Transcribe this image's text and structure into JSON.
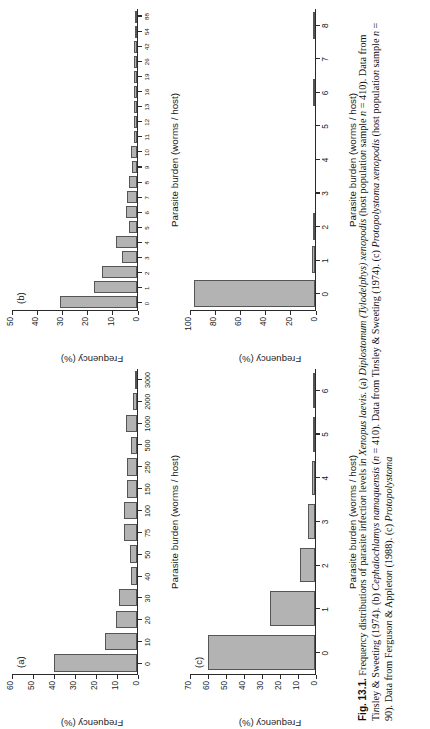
{
  "figure": {
    "label": "Fig. 13.1.",
    "caption_text": "Frequency distributions of parasite infection levels in Xenopus laevis. (a) Diplostomum (Tylodelphys) xenopodis (host population sample n = 410). Data from Tinsley & Sweeting (1974). (b) Cephalochlamys namaquensis (n = 410). Data from Tinsley & Sweeting (1974). (c) Protopolystoma xenopodis (host population sample n = 90). Data from Ferguson & Appleton (1988). (c) Protopolystoma",
    "caption_full": "Fig. 13.1. Frequency distributions of parasite infection levels in Xenopus laevis. (a) Diplostomum (Tylodelphys) xenopodis (host population sample n = 410). Data from Tinsley & Sweeting (1974). (b) Cephalochlamys namaquensis (n = 410). Data from Ferguson & Appleton (1988). (c) Protopolystoma"
  },
  "axis_titles": {
    "x": "Parasite burden (worms / host)",
    "y": "Frequency (%)"
  },
  "chart_data": [
    {
      "id": "a",
      "panel_letter": "(a)",
      "type": "bar",
      "title": "",
      "xlabel": "Parasite burden (worms / host)",
      "ylabel": "Frequency (%)",
      "ylim": [
        0,
        60
      ],
      "yticks": [
        0,
        10,
        20,
        30,
        40,
        50,
        60
      ],
      "grid": false,
      "categories": [
        "0",
        "10",
        "20",
        "30",
        "40",
        "50",
        "75",
        "100",
        "150",
        "250",
        "500",
        "1000",
        "2000",
        "3000"
      ],
      "values": [
        40.0,
        15.3,
        10.0,
        8.6,
        3.0,
        3.4,
        6.2,
        6.4,
        4.6,
        5.0,
        3.0,
        5.4,
        2.0,
        0.6
      ]
    },
    {
      "id": "b",
      "panel_letter": "(b)",
      "type": "bar",
      "title": "",
      "xlabel": "Parasite burden (worms / host)",
      "ylabel": "Frequency (%)",
      "ylim": [
        0,
        50
      ],
      "yticks": [
        0,
        10,
        20,
        30,
        40,
        50
      ],
      "grid": false,
      "categories": [
        "0",
        "1",
        "2",
        "3",
        "4",
        "5",
        "6",
        "7",
        "8",
        "9",
        "10",
        "11",
        "12",
        "13",
        "16",
        "19",
        "26",
        "42",
        "54",
        "88"
      ],
      "values": [
        31.0,
        17.4,
        14.2,
        6.0,
        8.6,
        3.2,
        4.6,
        4.0,
        3.2,
        2.0,
        2.6,
        1.3,
        1.1,
        1.2,
        1.2,
        1.1,
        1.1,
        1.1,
        1.0,
        1.0
      ]
    },
    {
      "id": "c",
      "panel_letter": "(c)",
      "type": "bar",
      "title": "",
      "xlabel": "Parasite burden (worms / host)",
      "ylabel": "Frequency (%)",
      "ylim": [
        0,
        70
      ],
      "yticks": [
        0,
        10,
        20,
        30,
        40,
        50,
        60,
        70
      ],
      "grid": false,
      "categories": [
        "0",
        "1",
        "2",
        "3",
        "4",
        "5",
        "6"
      ],
      "values": [
        60.0,
        25.0,
        8.6,
        4.0,
        1.6,
        1.4,
        1.0
      ]
    },
    {
      "id": "d",
      "panel_letter": "(d)",
      "type": "bar",
      "title": "",
      "xlabel": "Parasite burden (worms / host)",
      "ylabel": "Frequency (%)",
      "ylim": [
        0,
        100
      ],
      "yticks": [
        0,
        20,
        40,
        60,
        80,
        100
      ],
      "grid": false,
      "categories": [
        "0",
        "1",
        "2",
        "3",
        "4",
        "5",
        "6",
        "7",
        "8"
      ],
      "values": [
        97.0,
        2.2,
        0.6,
        0.0,
        0.0,
        0.0,
        0.7,
        0.0,
        0.7
      ]
    }
  ]
}
